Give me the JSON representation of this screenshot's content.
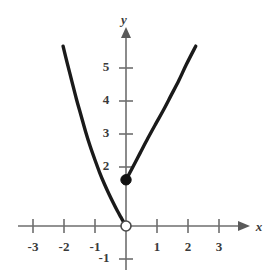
{
  "figure": {
    "kind": "cartesian-graph",
    "background_color": "#ffffff",
    "curve_color": "#1a1a1a",
    "axis_color": "#6e6e6e",
    "label_color": "#3a3a3a"
  },
  "axes": {
    "x_axis_label": "x",
    "y_axis_label": "y",
    "x_tick_labels": [
      "-3",
      "-2",
      "-1",
      "1",
      "2",
      "3"
    ],
    "y_tick_labels": [
      "5",
      "4",
      "3",
      "2",
      "-1"
    ],
    "x_label_minus3": "-3",
    "x_label_minus2": "-2",
    "x_label_minus1": "-1",
    "x_label_1": "1",
    "x_label_2": "2",
    "x_label_3": "3",
    "y_label_5": "5",
    "y_label_4": "4",
    "y_label_3": "3",
    "y_label_2": "2",
    "y_label_minus1": "-1"
  },
  "chart_data": {
    "type": "line",
    "title": "",
    "xlabel": "x",
    "ylabel": "y",
    "xlim": [
      -3.7,
      3.8
    ],
    "ylim": [
      -1.6,
      5.9
    ],
    "x_ticks": [
      -3,
      -2,
      -1,
      1,
      2,
      3
    ],
    "y_ticks": [
      5,
      4,
      3,
      2,
      -1
    ],
    "grid": false,
    "legend": "none",
    "origin_px": {
      "x": 126,
      "y": 226
    },
    "px_per_unit": {
      "x": 31,
      "y": 33
    },
    "series": [
      {
        "name": "left-branch",
        "description": "Upward curving branch for x less than 0, passing through the origin",
        "style": "solid",
        "points": [
          {
            "x": -2.03,
            "y": 5.45
          },
          {
            "x": -1.9,
            "y": 4.95
          },
          {
            "x": -1.75,
            "y": 4.4
          },
          {
            "x": -1.6,
            "y": 3.85
          },
          {
            "x": -1.45,
            "y": 3.35
          },
          {
            "x": -1.3,
            "y": 2.85
          },
          {
            "x": -1.15,
            "y": 2.4
          },
          {
            "x": -1.0,
            "y": 2.0
          },
          {
            "x": -0.85,
            "y": 1.62
          },
          {
            "x": -0.7,
            "y": 1.28
          },
          {
            "x": -0.55,
            "y": 0.97
          },
          {
            "x": -0.4,
            "y": 0.68
          },
          {
            "x": -0.28,
            "y": 0.46
          },
          {
            "x": -0.16,
            "y": 0.26
          },
          {
            "x": -0.06,
            "y": 0.09
          },
          {
            "x": 0,
            "y": 0
          }
        ]
      },
      {
        "name": "right-branch",
        "description": "Rising branch for x greater than 0, starting at the filled endpoint",
        "style": "solid",
        "points": [
          {
            "x": 0,
            "y": 1.4
          },
          {
            "x": 0.2,
            "y": 1.75
          },
          {
            "x": 0.45,
            "y": 2.2
          },
          {
            "x": 0.7,
            "y": 2.65
          },
          {
            "x": 0.95,
            "y": 3.08
          },
          {
            "x": 1.2,
            "y": 3.5
          },
          {
            "x": 1.45,
            "y": 3.95
          },
          {
            "x": 1.7,
            "y": 4.4
          },
          {
            "x": 1.95,
            "y": 4.9
          },
          {
            "x": 2.25,
            "y": 5.45
          }
        ]
      }
    ],
    "markers": [
      {
        "name": "closed-endpoint",
        "fill": "closed",
        "x": 0,
        "y": 1.4
      },
      {
        "name": "open-endpoint",
        "fill": "open",
        "x": 0,
        "y": 0
      }
    ]
  }
}
